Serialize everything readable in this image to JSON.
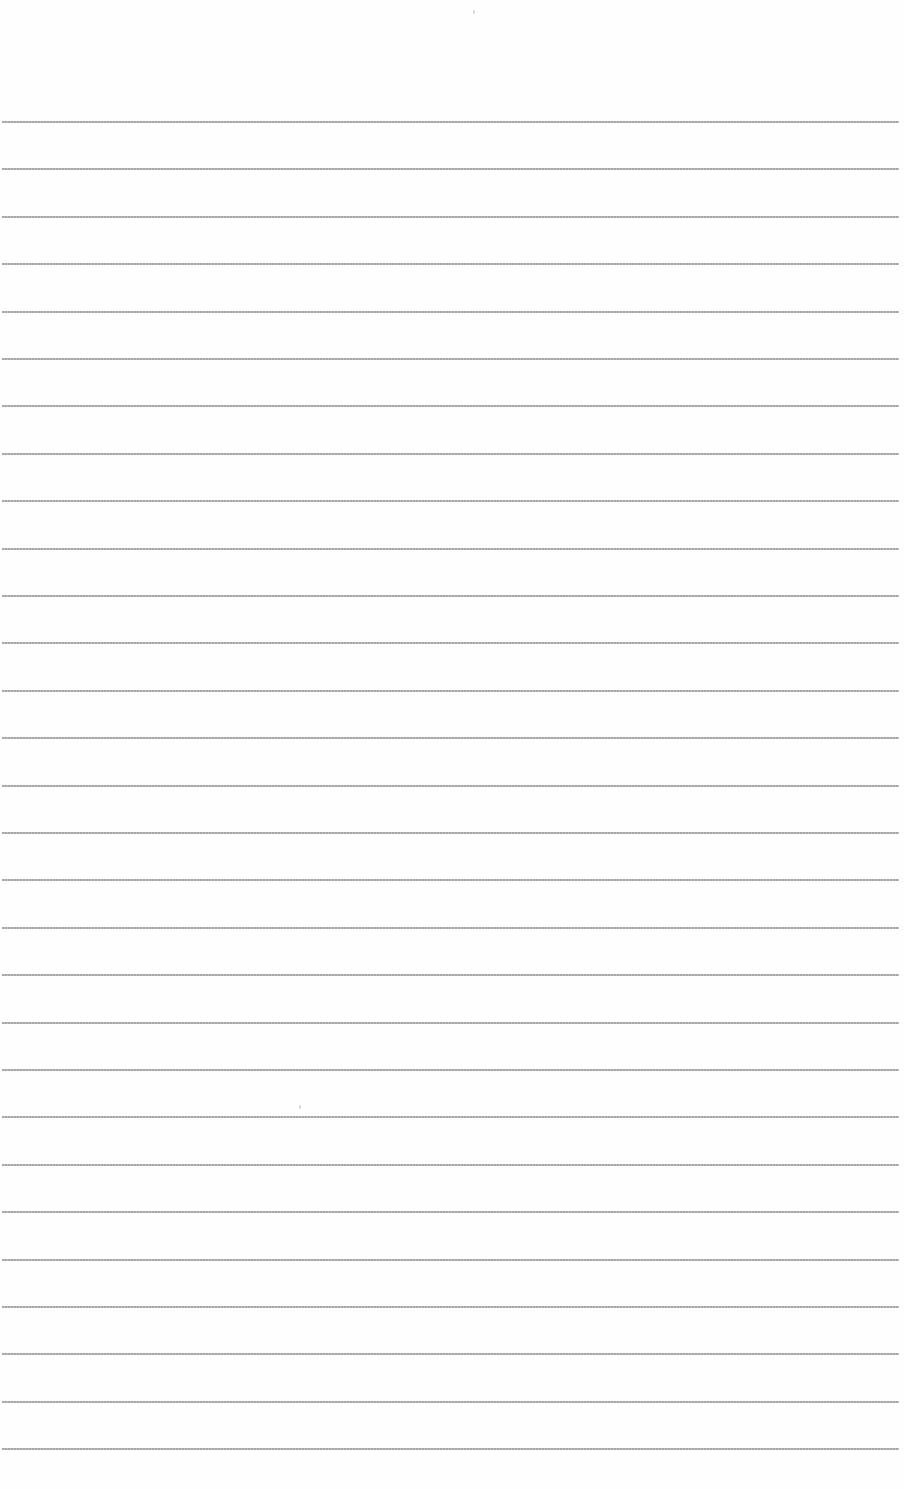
{
  "page": {
    "type": "lined-paper",
    "background_color": "#fefefe",
    "rule_color": "#9c9c9c",
    "rule_count": 29,
    "first_rule_y": 121,
    "rule_spacing": 47.4,
    "rule_left": 2,
    "rule_right": 899,
    "text_content": []
  }
}
